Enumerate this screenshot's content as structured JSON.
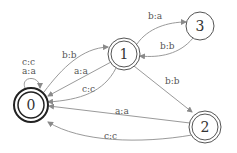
{
  "diagram": {
    "type": "finite-state-transducer",
    "colors": {
      "edge": "#9a9a9a",
      "node_stroke": "#555555",
      "initial_stroke": "#222222",
      "text": "#333333"
    },
    "nodes": [
      {
        "id": "0",
        "label": "0",
        "accepting": true,
        "initial": true
      },
      {
        "id": "1",
        "label": "1",
        "accepting": true
      },
      {
        "id": "2",
        "label": "2",
        "accepting": true
      },
      {
        "id": "3",
        "label": "3",
        "accepting": false
      }
    ],
    "edges": [
      {
        "from": "0",
        "to": "0",
        "label": "a:a"
      },
      {
        "from": "0",
        "to": "0",
        "label": "c:c"
      },
      {
        "from": "0",
        "to": "1",
        "label": "b:b"
      },
      {
        "from": "1",
        "to": "0",
        "label": "a:a"
      },
      {
        "from": "1",
        "to": "0",
        "label": "c:c"
      },
      {
        "from": "1",
        "to": "3",
        "label": "b:a"
      },
      {
        "from": "3",
        "to": "1",
        "label": "b:b"
      },
      {
        "from": "1",
        "to": "2",
        "label": "b:b"
      },
      {
        "from": "2",
        "to": "0",
        "label": "a:a"
      },
      {
        "from": "2",
        "to": "0",
        "label": "c:c"
      }
    ]
  }
}
